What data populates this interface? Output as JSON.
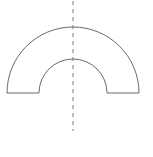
{
  "figure": {
    "name": "half-annulus-with-axis-of-symmetry",
    "canvas": {
      "width": 153,
      "height": 157,
      "background_color": "#ffffff"
    },
    "style": {
      "stroke_color": "#6b6b6b",
      "stroke_width": 1,
      "fill_color": "none",
      "symmetry_line_color": "#7a7a7a",
      "symmetry_line_width": 1,
      "symmetry_dash_pattern": "4 4"
    },
    "geometry": {
      "center_x": 73,
      "center_y": 93,
      "outer_radius": 66,
      "inner_radius": 34,
      "outer_left_x": 7,
      "outer_right_x": 139,
      "inner_left_x": 39,
      "inner_right_x": 107,
      "outer_apex_y": 27,
      "inner_apex_y": 59,
      "baseline_y": 93,
      "symmetry_line_x": 73,
      "symmetry_line_top_y": 1,
      "symmetry_line_bottom_y": 131
    },
    "shape_path": "M 7 93 A 66 66 0 0 1 139 93 L 107 93 A 34 34 0 0 0 39 93 Z",
    "symmetry_line_label": "axis-of-symmetry",
    "shape_label": "half-annulus-outline"
  }
}
